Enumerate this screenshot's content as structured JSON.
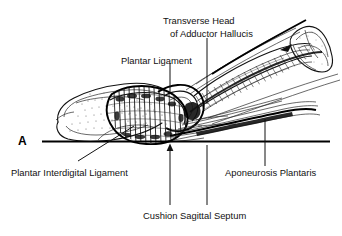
{
  "figure": {
    "panel_letter": "A",
    "background_color": "#ffffff",
    "ink_color": "#111111"
  },
  "labels": {
    "transverse_head_line1": "Transverse Head",
    "transverse_head_line2": "of Adductor Hallucis",
    "plantar_ligament": "Plantar Ligament",
    "plantar_interdigital_ligament": "Plantar Interdigital Ligament",
    "aponeurosis_plantaris": "Aponeurosis Plantaris",
    "cushion_sagittal_septum": "Cushion Sagittal Septum"
  },
  "structures": [
    {
      "name": "toe-phalanx",
      "label": "Toe phalanx soft tissue outline"
    },
    {
      "name": "plantar-fat-pad",
      "label": "Plantar fat pad with fibrous septa"
    },
    {
      "name": "metatarsal-head-bone",
      "label": "Metatarsal head bone cross section"
    },
    {
      "name": "adductor-hallucis-muscle",
      "label": "Transverse head of adductor hallucis muscle belly"
    },
    {
      "name": "plantar-aponeurosis-band",
      "label": "Plantar aponeurosis fibrous band"
    },
    {
      "name": "ground-reference-line",
      "label": "Horizontal ground reference line"
    }
  ]
}
